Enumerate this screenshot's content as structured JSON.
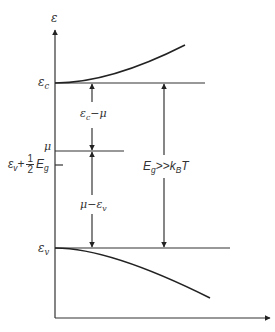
{
  "diagram": {
    "axis": {
      "y_label": "ε"
    },
    "levels": {
      "conduction_band_edge": {
        "symbol": "ε",
        "subscript": "c"
      },
      "chemical_potential": {
        "symbol": "μ"
      },
      "midgap": {
        "prefix": "ε",
        "prefix_sub": "v",
        "plus": "+",
        "frac_num": "1",
        "frac_den": "2",
        "suffix": "E",
        "suffix_sub": "g"
      },
      "valence_band_edge": {
        "symbol": "ε",
        "subscript": "v"
      }
    },
    "arrows": {
      "ec_minus_mu": {
        "a": "ε",
        "a_sub": "c",
        "op": "−",
        "b": "μ"
      },
      "mu_minus_ev": {
        "a": "μ",
        "op": "−",
        "b": "ε",
        "b_sub": "v"
      },
      "gap": {
        "a": "E",
        "a_sub": "g",
        "op": ">>",
        "b": "k",
        "b_sub": "B",
        "c": "T"
      }
    },
    "colors": {
      "line": "#333333",
      "background": "#ffffff"
    }
  }
}
